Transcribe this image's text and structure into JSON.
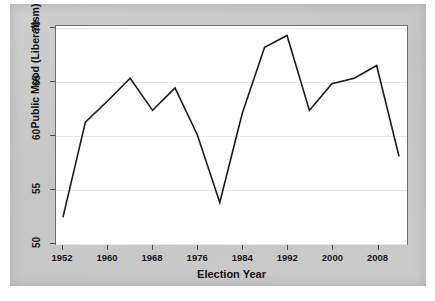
{
  "chart_data": {
    "type": "line",
    "title": "",
    "xlabel": "Election Year",
    "ylabel": "Public Mood (Liberalism)",
    "xlim": [
      1952,
      2012
    ],
    "ylim": [
      50,
      70
    ],
    "grid": true,
    "legend": null,
    "line_color": "#1a1a1a",
    "x": [
      1952,
      1956,
      1960,
      1964,
      1968,
      1972,
      1976,
      1980,
      1984,
      1988,
      1992,
      1996,
      2000,
      2004,
      2008,
      2012
    ],
    "values": [
      52.3,
      61.2,
      63.2,
      65.3,
      62.3,
      64.4,
      60.0,
      53.7,
      62.0,
      68.2,
      69.3,
      62.3,
      64.8,
      65.3,
      66.5,
      58.0
    ],
    "xticks": [
      1952,
      1960,
      1968,
      1976,
      1984,
      1992,
      2000,
      2008
    ],
    "xtick_labels": [
      "1952",
      "1960",
      "1968",
      "1976",
      "1984",
      "1992",
      "2000",
      "2008"
    ],
    "yticks": [
      50,
      55,
      60,
      65,
      70
    ],
    "ytick_labels": [
      "50",
      "55",
      "60",
      "65",
      "70"
    ]
  },
  "axes": {
    "x_title": "Election Year",
    "y_title": "Public Mood (Liberalism)"
  }
}
